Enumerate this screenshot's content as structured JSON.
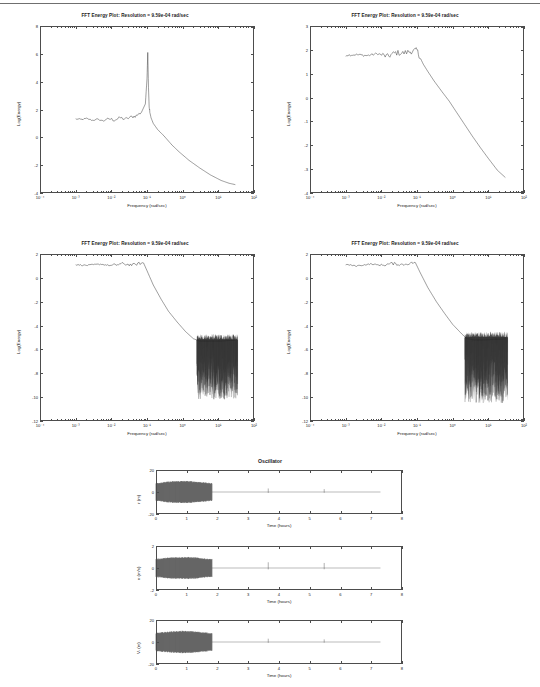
{
  "figure": {
    "kind": "matlab-figure-sheet",
    "background": "#ffffff",
    "curve_color": "#262626",
    "axis_color": "#4d4d4d"
  },
  "fft_panels": [
    {
      "id": "fft-top-left",
      "title": "FFT Energy Plot: Resolution =   9.59e-04 rad/sec",
      "xlabel": "Frequency (rad/sec)",
      "ylabel": "Log(Energy)",
      "xticks": [
        "10⁻⁴",
        "10⁻³",
        "10⁻²",
        "10⁻¹",
        "10⁰",
        "10¹",
        "10²"
      ],
      "yticks": [
        "8",
        "6",
        "4",
        "2",
        "0",
        "-2",
        "-4"
      ]
    },
    {
      "id": "fft-top-right",
      "title": "FFT Energy Plot: Resolution =   9.59e-04 rad/sec",
      "xlabel": "Frequency (rad/sec)",
      "ylabel": "Log(Energy)",
      "xticks": [
        "10⁻⁴",
        "10⁻³",
        "10⁻²",
        "10⁻¹",
        "10⁰",
        "10¹",
        "10²"
      ],
      "yticks": [
        "3",
        "2",
        "1",
        "0",
        "-1",
        "-2",
        "-3",
        "-4"
      ]
    },
    {
      "id": "fft-bottom-left",
      "title": "FFT Energy Plot: Resolution =   9.59e-04 rad/sec",
      "xlabel": "Frequency (rad/sec)",
      "ylabel": "Log(Energy)",
      "xticks": [
        "10⁻⁴",
        "10⁻³",
        "10⁻²",
        "10⁻¹",
        "10⁰",
        "10¹",
        "10²"
      ],
      "yticks": [
        "2",
        "0",
        "-2",
        "-4",
        "-6",
        "-8",
        "-10",
        "-12"
      ]
    },
    {
      "id": "fft-bottom-right",
      "title": "FFT Energy Plot: Resolution =   9.59e-04 rad/sec",
      "xlabel": "Frequency (rad/sec)",
      "ylabel": "Log(Energy)",
      "xticks": [
        "10⁻⁴",
        "10⁻³",
        "10⁻²",
        "10⁻¹",
        "10⁰",
        "10¹",
        "10²"
      ],
      "yticks": [
        "2",
        "0",
        "-2",
        "-4",
        "-6",
        "-8",
        "-10",
        "-12"
      ]
    }
  ],
  "oscillator": {
    "title": "Oscillator",
    "panels": [
      {
        "id": "osc-r",
        "ylabel": "r (m)",
        "xlabel": "Time (hours)",
        "yticks": [
          "20",
          "0",
          "-20"
        ],
        "xticks": [
          "0",
          "1",
          "2",
          "3",
          "4",
          "5",
          "6",
          "7",
          "8"
        ]
      },
      {
        "id": "osc-v",
        "ylabel": "v (m/s)",
        "xlabel": "Time (hours)",
        "yticks": [
          "2",
          "0",
          "-2"
        ],
        "xticks": [
          "0",
          "1",
          "2",
          "3",
          "4",
          "5",
          "6",
          "7",
          "8"
        ]
      },
      {
        "id": "osc-vr",
        "ylabel": "Vᵣ (m)",
        "xlabel": "Time (hours)",
        "yticks": [
          "20",
          "0",
          "-20"
        ],
        "xticks": [
          "0",
          "1",
          "2",
          "3",
          "4",
          "5",
          "6",
          "7",
          "8"
        ]
      }
    ]
  },
  "chart_data": [
    {
      "type": "line",
      "id": "fft-top-left",
      "title": "FFT Energy Plot: Resolution =   9.59e-04 rad/sec",
      "xlabel": "Frequency (rad/sec)",
      "ylabel": "Log(Energy)",
      "xscale": "log",
      "xlim": [
        0.0001,
        100
      ],
      "ylim": [
        -4,
        8
      ],
      "grid": false,
      "legend": "none",
      "description": "Flat noise floor near Log(Energy)=1.3 from 1e-3 to 5e-2, sharp resonance peak reaching 6.1 at 1.1e-1, then monotone power-law decay to -3.4 at 3e1",
      "x": [
        0.001,
        0.0015,
        0.002,
        0.003,
        0.004,
        0.006,
        0.008,
        0.012,
        0.018,
        0.025,
        0.035,
        0.05,
        0.07,
        0.09,
        0.1,
        0.105,
        0.11,
        0.115,
        0.12,
        0.13,
        0.15,
        0.2,
        0.3,
        0.5,
        0.8,
        1.5,
        3,
        6,
        12,
        20,
        30
      ],
      "y": [
        1.32,
        1.28,
        1.35,
        1.22,
        1.3,
        1.18,
        1.34,
        1.25,
        1.4,
        1.3,
        1.45,
        1.55,
        1.8,
        2.4,
        4.2,
        6.1,
        3.6,
        2.2,
        1.8,
        1.4,
        1.0,
        0.55,
        0.1,
        -0.55,
        -1.05,
        -1.65,
        -2.2,
        -2.7,
        -3.1,
        -3.3,
        -3.4
      ]
    },
    {
      "type": "line",
      "id": "fft-top-right",
      "title": "FFT Energy Plot: Resolution =   9.59e-04 rad/sec",
      "xlabel": "Frequency (rad/sec)",
      "ylabel": "Log(Energy)",
      "xscale": "log",
      "xlim": [
        0.0001,
        100
      ],
      "ylim": [
        -4,
        3
      ],
      "grid": false,
      "legend": "none",
      "description": "Flat plateau near 1.75-2.0 up to 1e-1 with small ripple, then steep roll-off to -3.35 at 3e1",
      "x": [
        0.001,
        0.002,
        0.004,
        0.008,
        0.015,
        0.025,
        0.04,
        0.06,
        0.08,
        0.1,
        0.12,
        0.15,
        0.2,
        0.3,
        0.5,
        0.8,
        1.2,
        2,
        3.5,
        6,
        10,
        18,
        30
      ],
      "y": [
        1.78,
        1.8,
        1.76,
        1.84,
        1.72,
        1.88,
        1.86,
        1.92,
        1.96,
        1.98,
        1.7,
        1.4,
        1.1,
        0.7,
        0.25,
        -0.15,
        -0.55,
        -1.05,
        -1.6,
        -2.1,
        -2.55,
        -3.05,
        -3.35
      ]
    },
    {
      "type": "line",
      "id": "fft-bottom-left",
      "title": "FFT Energy Plot: Resolution =   9.59e-04 rad/sec",
      "xlabel": "Frequency (rad/sec)",
      "ylabel": "Log(Energy)",
      "xscale": "log",
      "xlim": [
        0.0001,
        100
      ],
      "ylim": [
        -12,
        2
      ],
      "grid": false,
      "legend": "none",
      "description": "Plateau near 1.1 to 8e-2, steep linear decay to about -5.3 at 3e0, then broad noise band between -5.2 and -10 out to 3e1",
      "x": [
        0.001,
        0.002,
        0.005,
        0.01,
        0.02,
        0.04,
        0.06,
        0.08,
        0.1,
        0.15,
        0.25,
        0.4,
        0.7,
        1.2,
        2,
        3,
        6,
        12,
        20,
        30
      ],
      "y": [
        1.1,
        1.05,
        1.15,
        1.02,
        1.18,
        1.08,
        1.2,
        1.25,
        0.6,
        -0.6,
        -1.8,
        -2.8,
        -3.7,
        -4.5,
        -5.1,
        -5.3,
        -5.3,
        -5.3,
        -5.25,
        -5.25
      ],
      "noise_band": {
        "x_start": 2.5,
        "x_end": 35,
        "y_top": -5.2,
        "y_bottom": -10.2
      }
    },
    {
      "type": "line",
      "id": "fft-bottom-right",
      "title": "FFT Energy Plot: Resolution =   9.59e-04 rad/sec",
      "xlabel": "Frequency (rad/sec)",
      "ylabel": "Log(Energy)",
      "xscale": "log",
      "xlim": [
        0.0001,
        100
      ],
      "ylim": [
        -12,
        2
      ],
      "grid": false,
      "legend": "none",
      "description": "Plateau near 1.1 to 1e-1, steep decay to about -5.2 at 2.5e0, then broad noise band between -5.0 and -10.5 out to 3e1",
      "x": [
        0.001,
        0.002,
        0.005,
        0.01,
        0.02,
        0.04,
        0.06,
        0.09,
        0.12,
        0.2,
        0.35,
        0.6,
        1,
        1.8,
        2.5,
        4,
        8,
        15,
        25,
        32
      ],
      "y": [
        1.12,
        1.0,
        1.16,
        1.05,
        1.2,
        1.1,
        1.22,
        1.28,
        0.5,
        -0.8,
        -2.0,
        -3.0,
        -3.9,
        -4.7,
        -5.1,
        -5.2,
        -5.2,
        -5.15,
        -5.15,
        -5.1
      ],
      "noise_band": {
        "x_start": 2.2,
        "x_end": 35,
        "y_top": -5.0,
        "y_bottom": -10.5
      }
    },
    {
      "type": "line",
      "id": "osc-r",
      "title": "Oscillator",
      "xlabel": "Time (hours)",
      "ylabel": "r (m)",
      "xlim": [
        0,
        8
      ],
      "ylim": [
        -20,
        20
      ],
      "grid": false,
      "legend": "none",
      "description": "Dense oscillation envelope of amplitude ~10 m from t=0 to t=1.82 h, then flat near zero with two narrow spikes at t=3.65 and t=5.47 and signal ending at t=7.3",
      "envelope": {
        "t_start": 0,
        "t_end": 1.82,
        "amplitude": 10
      },
      "spikes": [
        {
          "t": 3.65,
          "amplitude": 3.2
        },
        {
          "t": 5.47,
          "amplitude": 2.6
        }
      ],
      "signal_end": 7.3
    },
    {
      "type": "line",
      "id": "osc-v",
      "title": "",
      "xlabel": "Time (hours)",
      "ylabel": "v (m/s)",
      "xlim": [
        0,
        8
      ],
      "ylim": [
        -2,
        2
      ],
      "grid": false,
      "legend": "none",
      "description": "Dense oscillation envelope of amplitude ~1 m/s from t=0 to t=1.82 h, then flat near zero with two narrow spikes at t=3.65 and t=5.47",
      "envelope": {
        "t_start": 0,
        "t_end": 1.82,
        "amplitude": 1.0
      },
      "spikes": [
        {
          "t": 3.65,
          "amplitude": 0.52
        },
        {
          "t": 5.47,
          "amplitude": 0.46
        }
      ],
      "signal_end": 7.3
    },
    {
      "type": "line",
      "id": "osc-vr",
      "title": "",
      "xlabel": "Time (hours)",
      "ylabel": "Vᵣ (m)",
      "xlim": [
        0,
        8
      ],
      "ylim": [
        -20,
        20
      ],
      "grid": false,
      "legend": "none",
      "description": "Dense oscillation envelope of amplitude ~10 m from t=0 to t=1.82 h, then flat near zero with two narrow spikes at t=3.65 and t=5.47",
      "envelope": {
        "t_start": 0,
        "t_end": 1.82,
        "amplitude": 10
      },
      "spikes": [
        {
          "t": 3.65,
          "amplitude": 3.0
        },
        {
          "t": 5.47,
          "amplitude": 2.4
        }
      ],
      "signal_end": 7.3
    }
  ]
}
